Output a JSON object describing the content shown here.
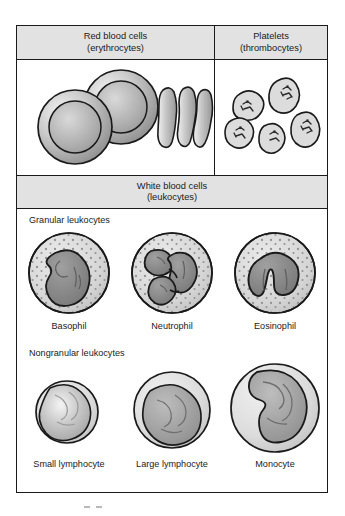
{
  "figure": {
    "sections": [
      {
        "id": "red-blood-cells",
        "name": "Red blood cells",
        "subtitle": "(erythrocytes)",
        "illustration": "two biconcave discs viewed from above and three cells viewed edge-on"
      },
      {
        "id": "platelets",
        "name": "Platelets",
        "subtitle": "(thrombocytes)",
        "illustration": "five small irregular granule-containing fragments"
      },
      {
        "id": "white-blood-cells",
        "name": "White blood cells",
        "subtitle": "(leukocytes)",
        "groups": [
          {
            "id": "granular-leukocytes",
            "label": "Granular leukocytes",
            "cells": [
              {
                "id": "basophil",
                "label": "Basophil",
                "nucleus": "bilobed kidney-shaped"
              },
              {
                "id": "neutrophil",
                "label": "Neutrophil",
                "nucleus": "multilobed segmented"
              },
              {
                "id": "eosinophil",
                "label": "Eosinophil",
                "nucleus": "bilobed horseshoe"
              }
            ]
          },
          {
            "id": "nongranular-leukocytes",
            "label": "Nongranular leukocytes",
            "cells": [
              {
                "id": "small-lymphocyte",
                "label": "Small lymphocyte",
                "nucleus": "round, fills cell"
              },
              {
                "id": "large-lymphocyte",
                "label": "Large lymphocyte",
                "nucleus": "round, thin rim of cytoplasm"
              },
              {
                "id": "monocyte",
                "label": "Monocyte",
                "nucleus": "kidney-shaped"
              }
            ]
          }
        ]
      }
    ]
  },
  "colors": {
    "outline": "#1a1a1a",
    "header_fill": "#e2e2e2",
    "cytoplasm": "#d6d6d6",
    "nucleus": "#8d8d8d",
    "rbc_rim": "#b3b3b3",
    "page_background": "#ffffff"
  }
}
